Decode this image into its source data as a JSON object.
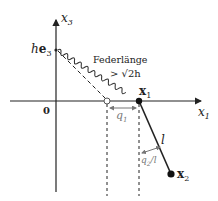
{
  "diagram": {
    "axes": {
      "horizontal_label": "x",
      "horizontal_sub": "1",
      "vertical_label": "x",
      "vertical_sub": "3",
      "origin_label": "0"
    },
    "anchor": {
      "label_h": "h",
      "label_e": "e",
      "label_sub": "3"
    },
    "spring": {
      "label_line1": "Federlänge",
      "label_line2": "> √2h"
    },
    "mass1": {
      "label": "x",
      "sub": "1"
    },
    "mass2": {
      "label": "x",
      "sub": "2"
    },
    "pendulum": {
      "length_label": "l"
    },
    "displacement1": {
      "label": "q",
      "sub": "1"
    },
    "angle": {
      "label": "q",
      "sub": "2",
      "suffix": "/l"
    },
    "colors": {
      "ink": "#222222",
      "gray": "#888888",
      "spring": "#333333"
    }
  }
}
